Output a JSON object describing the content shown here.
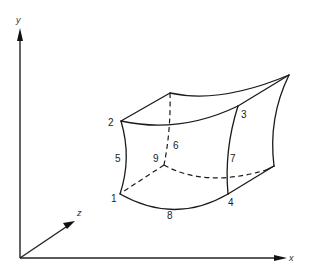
{
  "figure": {
    "type": "isoparametric-element-diagram",
    "colors": {
      "line": "#1a1a1a",
      "background": "#ffffff"
    }
  },
  "axes": {
    "x_label": "x",
    "y_label": "y",
    "z_label": "z"
  },
  "nodes": [
    {
      "id": "1",
      "label": "1"
    },
    {
      "id": "2",
      "label": "2"
    },
    {
      "id": "3",
      "label": "3"
    },
    {
      "id": "4",
      "label": "4"
    },
    {
      "id": "5",
      "label": "5"
    },
    {
      "id": "6",
      "label": "6"
    },
    {
      "id": "7",
      "label": "7"
    },
    {
      "id": "8",
      "label": "8"
    },
    {
      "id": "9",
      "label": "9"
    }
  ]
}
